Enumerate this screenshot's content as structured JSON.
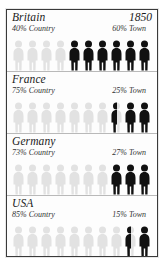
{
  "chart_data": {
    "type": "bar",
    "title": "Britain",
    "subtitle": "1850",
    "xlabel": "",
    "ylabel": "",
    "legend": [
      "Country",
      "Town"
    ],
    "legend_position": "inline-per-row",
    "grid": false,
    "units_per_row": 10,
    "unit_value": 10,
    "colors": {
      "country": "#e2e2e2",
      "town": "#111111",
      "border": "#3a3a3a",
      "background": "#fdfdfd"
    },
    "categories": [
      "Britain",
      "France",
      "Germany",
      "USA"
    ],
    "series": [
      {
        "name": "Country",
        "values": [
          40,
          75,
          73,
          85
        ]
      },
      {
        "name": "Town",
        "values": [
          60,
          25,
          27,
          15
        ]
      }
    ]
  },
  "frame": {
    "year": "1850"
  },
  "sections": [
    {
      "name": "Britain",
      "year": "1850",
      "country_label": "40% Country",
      "town_label": "60% Town",
      "country_pct": 40,
      "town_pct": 60,
      "country_figures": 4,
      "town_figures": 6
    },
    {
      "name": "France",
      "year": "",
      "country_label": "75% Country",
      "town_label": "25% Town",
      "country_pct": 75,
      "town_pct": 25,
      "country_figures": 7.5,
      "town_figures": 2.5
    },
    {
      "name": "Germany",
      "year": "",
      "country_label": "73% Country",
      "town_label": "27% Town",
      "country_pct": 73,
      "town_pct": 27,
      "country_figures": 7,
      "town_figures": 3
    },
    {
      "name": "USA",
      "year": "",
      "country_label": "85% Country",
      "town_label": "15% Town",
      "country_pct": 85,
      "town_pct": 15,
      "country_figures": 8.5,
      "town_figures": 1.5
    }
  ]
}
